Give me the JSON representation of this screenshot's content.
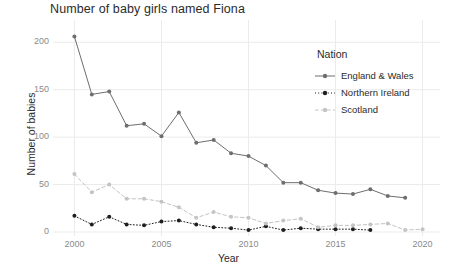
{
  "chart_data": {
    "type": "line",
    "title": "Number of baby girls named Fiona",
    "xlabel": "Year",
    "ylabel": "Number of babies",
    "x": [
      2000,
      2001,
      2002,
      2003,
      2004,
      2005,
      2006,
      2007,
      2008,
      2009,
      2010,
      2011,
      2012,
      2013,
      2014,
      2015,
      2016,
      2017,
      2018,
      2019,
      2020
    ],
    "xlim": [
      1999,
      2021
    ],
    "ylim": [
      0,
      215
    ],
    "xticks": [
      2000,
      2005,
      2010,
      2015,
      2020
    ],
    "yticks": [
      0,
      50,
      100,
      150,
      200
    ],
    "xtick_labels": [
      "2000",
      "2005",
      "2010",
      "2015",
      "2020"
    ],
    "ytick_labels": [
      "0",
      "50",
      "100",
      "150",
      "200"
    ],
    "grid": true,
    "legend_position": "right",
    "legend_title": "Nation",
    "series": [
      {
        "name": "England & Wales",
        "color": "#6e6e6e",
        "linestyle": "solid",
        "x": [
          2000,
          2001,
          2002,
          2003,
          2004,
          2005,
          2006,
          2007,
          2008,
          2009,
          2010,
          2011,
          2012,
          2013,
          2014,
          2015,
          2016,
          2017,
          2018,
          2019
        ],
        "values": [
          206,
          145,
          148,
          112,
          114,
          101,
          126,
          94,
          97,
          83,
          80,
          70,
          52,
          52,
          44,
          41,
          40,
          45,
          38,
          36
        ]
      },
      {
        "name": "Northern Ireland",
        "color": "#1f1f1f",
        "linestyle": "dotted",
        "x": [
          2000,
          2001,
          2002,
          2003,
          2004,
          2005,
          2006,
          2007,
          2008,
          2009,
          2010,
          2011,
          2012,
          2013,
          2014,
          2015,
          2016,
          2017
        ],
        "values": [
          17,
          8,
          16,
          8,
          7,
          11,
          12,
          8,
          5,
          4,
          2,
          6,
          2,
          4,
          3,
          3,
          3,
          2
        ]
      },
      {
        "name": "Scotland",
        "color": "#c4c4c4",
        "linestyle": "dashed",
        "x": [
          2000,
          2001,
          2002,
          2003,
          2004,
          2005,
          2006,
          2007,
          2008,
          2009,
          2010,
          2011,
          2012,
          2013,
          2014,
          2015,
          2016,
          2017,
          2018,
          2019,
          2020
        ],
        "values": [
          61,
          42,
          50,
          35,
          35,
          32,
          26,
          15,
          21,
          16,
          15,
          9,
          12,
          14,
          5,
          7,
          7,
          8,
          9,
          2,
          3
        ]
      }
    ]
  },
  "legend": {
    "title": "Nation",
    "items": [
      {
        "label": "England & Wales"
      },
      {
        "label": "Northern Ireland"
      },
      {
        "label": "Scotland"
      }
    ]
  },
  "axes": {
    "x_title": "Year",
    "y_title": "Number of babies"
  },
  "colors": {
    "england_wales": "#6e6e6e",
    "northern_ireland": "#1f1f1f",
    "scotland": "#c4c4c4",
    "grid": "#ebebeb",
    "text": "#2b2b2b",
    "tick_text": "#8a8a8a",
    "panel_background": "#ffffff"
  }
}
